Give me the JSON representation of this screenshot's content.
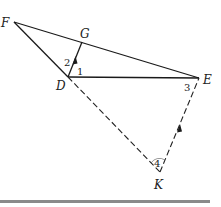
{
  "diagram": {
    "points": {
      "F": {
        "label": "F",
        "x": 14,
        "y": 22
      },
      "G": {
        "label": "G",
        "x": 82,
        "y": 42
      },
      "D": {
        "label": "D",
        "x": 68,
        "y": 77
      },
      "E": {
        "label": "E",
        "x": 199,
        "y": 78
      },
      "K": {
        "label": "K",
        "x": 160,
        "y": 172
      }
    },
    "angles": {
      "a1": "1",
      "a2": "2",
      "a3": "3",
      "a4": "4"
    },
    "segments_solid": [
      "FE",
      "FD",
      "DG",
      "DE"
    ],
    "segments_dashed": [
      "DK",
      "EK"
    ],
    "parallel_marks": [
      "DG",
      "KE"
    ],
    "colors": {
      "line": "#1a1a1a",
      "bar": "#8a8a8a"
    }
  }
}
